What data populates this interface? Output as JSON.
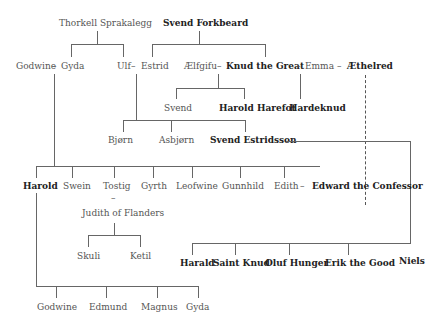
{
  "diagram": {
    "type": "family-tree",
    "nodes": {
      "thorkell": "Thorkell Sprakalegg",
      "svend_forkbeard": "Svend Forkbeard",
      "godwine": "Godwine",
      "gyda": "Gyda",
      "ulf": "Ulf",
      "estrid": "Estrid",
      "aelfgifu": "Ælfgifu",
      "knud": "Knud the Great",
      "emma": "Emma",
      "aethelred": "Æthelred",
      "svend": "Svend",
      "harold_harefot": "Harold Harefot",
      "hardeknud": "Hardeknud",
      "bjorn": "Bjørn",
      "asbjorn": "Asbjørn",
      "svend_estridsson": "Svend Estridsson",
      "harold": "Harold",
      "swein": "Swein",
      "tostig": "Tostig",
      "gyrth": "Gyrth",
      "leofwine": "Leofwine",
      "gunnhild": "Gunnhild",
      "edith": "Edith",
      "edward": "Edward the Confessor",
      "judith": "Judith of Flanders",
      "skuli": "Skuli",
      "ketil": "Ketil",
      "harald": "Harald",
      "saint_knud": "Saint Knud",
      "oluf": "Oluf Hunger",
      "erik": "Erik the Good",
      "niels": "Niels",
      "godwine2": "Godwine",
      "edmund": "Edmund",
      "magnus": "Magnus",
      "gyda2": "Gyda"
    },
    "marriage_symbol": "–",
    "marriages": [
      [
        "godwine",
        "gyda"
      ],
      [
        "ulf",
        "estrid"
      ],
      [
        "aelfgifu",
        "knud"
      ],
      [
        "knud",
        "emma"
      ],
      [
        "emma",
        "aethelred"
      ],
      [
        "edith",
        "edward"
      ],
      [
        "tostig",
        "judith"
      ]
    ],
    "bold_nodes": [
      "svend_forkbeard",
      "knud",
      "aethelred",
      "harold_harefot",
      "hardeknud",
      "svend_estridsson",
      "harold",
      "edward",
      "harald",
      "saint_knud",
      "oluf",
      "erik",
      "niels"
    ],
    "dashed_links": [
      [
        "aethelred",
        "edward"
      ]
    ]
  }
}
